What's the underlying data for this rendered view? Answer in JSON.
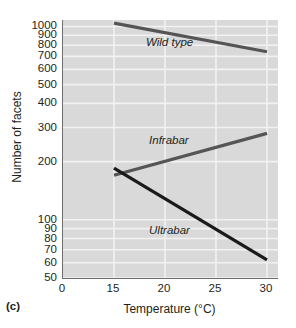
{
  "figure": {
    "panel_letter": "(c)",
    "background": "#d9d9d9",
    "gridline_color": "#f2f2f2",
    "axis_color": "#6e6e6e"
  },
  "chart_data": {
    "type": "line",
    "title": "",
    "xlabel": "Temperature (°C)",
    "ylabel": "Number of facets",
    "yscale": "log",
    "ylim": [
      50,
      1080
    ],
    "xlim": [
      0,
      31.5
    ],
    "grid": true,
    "legend": "inline-labels",
    "xticks": [
      0,
      15,
      20,
      25,
      30
    ],
    "xtick_labels": [
      "0",
      "15",
      "20",
      "25",
      "30"
    ],
    "yticks": [
      50,
      60,
      70,
      80,
      90,
      100,
      200,
      300,
      400,
      500,
      600,
      700,
      800,
      900,
      1000
    ],
    "ytick_labels": [
      "50",
      "60",
      "70",
      "80",
      "90",
      "100",
      "200",
      "300",
      "400",
      "500",
      "600",
      "700",
      "800",
      "900",
      "1000"
    ],
    "x": [
      15,
      30
    ],
    "series": [
      {
        "name": "Wild type",
        "values": [
          1040,
          740
        ],
        "color": "#555555",
        "width": 3.2,
        "label_x": 20.0,
        "label_y": 820
      },
      {
        "name": "Infrabar",
        "values": [
          170,
          280
        ],
        "color": "#555555",
        "width": 3.2,
        "label_x": 20.3,
        "label_y": 255
      },
      {
        "name": "Ultrabar",
        "values": [
          185,
          62
        ],
        "color": "#1a1a1a",
        "width": 3.2,
        "label_x": 20.3,
        "label_y": 88
      }
    ]
  }
}
